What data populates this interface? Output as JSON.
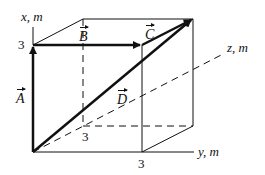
{
  "diagram": {
    "type": "3d-vector-box",
    "axes": {
      "x": {
        "label": "x, m",
        "tick": "3"
      },
      "y": {
        "label": "y, m",
        "tick": "3"
      },
      "z": {
        "label": "z, m",
        "tick": "3"
      }
    },
    "vectors": [
      {
        "name": "A",
        "from": [
          0,
          0,
          0
        ],
        "to": [
          3,
          0,
          0
        ]
      },
      {
        "name": "B",
        "from": [
          3,
          0,
          0
        ],
        "to": [
          3,
          0,
          3
        ]
      },
      {
        "name": "C",
        "from": [
          3,
          0,
          3
        ],
        "to": [
          3,
          3,
          3
        ]
      },
      {
        "name": "D",
        "from": [
          0,
          0,
          0
        ],
        "to": [
          3,
          3,
          3
        ]
      }
    ],
    "colors": {
      "line": "#111111",
      "background": "#ffffff"
    }
  }
}
